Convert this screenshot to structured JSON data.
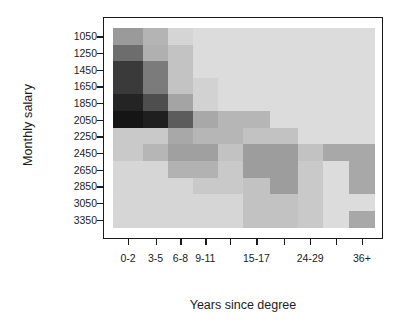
{
  "chart_data": {
    "type": "heatmap",
    "title": "",
    "xlabel": "Years since degree",
    "ylabel": "Monthly salary",
    "grid": false,
    "legend": "none",
    "x_categories": [
      "0-2",
      "3-5",
      "6-8",
      "9-11",
      "12-14",
      "15-17",
      "18-23",
      "24-29",
      "30-35",
      "36+"
    ],
    "x_tick_labels": [
      "0-2",
      "3-5",
      "6-8",
      "9-11",
      "",
      "15-17",
      "",
      "24-29",
      "",
      "36+"
    ],
    "y_categories": [
      "1050",
      "1250",
      "1450",
      "1650",
      "1850",
      "2050",
      "2250",
      "2450",
      "2650",
      "2850",
      "3050",
      "3350"
    ],
    "y_tick_labels": [
      "1050",
      "1250",
      "1450",
      "1650",
      "1850",
      "2050",
      "2250",
      "2450",
      "2650",
      "2850",
      "3050",
      "3350"
    ],
    "colorscale": {
      "type": "grayscale",
      "min_label": "low density",
      "max_label": "high density",
      "stops": [
        "#e2e2e2",
        "#d3d3d3",
        "#c4c4c4",
        "#a8a8a8",
        "#8c8c8c",
        "#6e6e6e",
        "#4a4a4a",
        "#2b2b2b",
        "#141414"
      ]
    },
    "values": [
      [
        0.62,
        0.5,
        0.3,
        0.14,
        0.14,
        0.14,
        0.14,
        0.14,
        0.14,
        0.14
      ],
      [
        0.74,
        0.5,
        0.38,
        0.14,
        0.14,
        0.14,
        0.14,
        0.14,
        0.14,
        0.14
      ],
      [
        0.92,
        0.66,
        0.38,
        0.14,
        0.14,
        0.14,
        0.14,
        0.14,
        0.14,
        0.14
      ],
      [
        0.92,
        0.66,
        0.38,
        0.3,
        0.14,
        0.14,
        0.14,
        0.14,
        0.14,
        0.14
      ],
      [
        0.95,
        0.86,
        0.46,
        0.3,
        0.14,
        0.14,
        0.14,
        0.14,
        0.14,
        0.14
      ],
      [
        0.98,
        0.92,
        0.66,
        0.38,
        0.3,
        0.14,
        0.14,
        0.14,
        0.14,
        0.14
      ],
      [
        0.24,
        0.3,
        0.48,
        0.3,
        0.3,
        0.14,
        0.14,
        0.14,
        0.14,
        0.14
      ],
      [
        0.24,
        0.36,
        0.48,
        0.48,
        0.24,
        0.44,
        0.44,
        0.24,
        0.36,
        0.36
      ],
      [
        0.18,
        0.18,
        0.36,
        0.24,
        0.24,
        0.44,
        0.44,
        0.24,
        0.14,
        0.36
      ],
      [
        0.18,
        0.18,
        0.18,
        0.24,
        0.24,
        0.3,
        0.44,
        0.24,
        0.14,
        0.36
      ],
      [
        0.18,
        0.18,
        0.18,
        0.18,
        0.18,
        0.3,
        0.3,
        0.24,
        0.14,
        0.14
      ],
      [
        0.18,
        0.18,
        0.18,
        0.18,
        0.18,
        0.3,
        0.3,
        0.24,
        0.14,
        0.36
      ]
    ],
    "cells": [
      {
        "x": 0,
        "y": 0,
        "w": 1,
        "h": 1,
        "color": "#9a9a9a"
      },
      {
        "x": 1,
        "y": 0,
        "w": 1,
        "h": 1,
        "color": "#b4b4b4"
      },
      {
        "x": 2,
        "y": 0,
        "w": 1,
        "h": 1,
        "color": "#d5d5d5"
      },
      {
        "x": 3,
        "y": 0,
        "w": 7,
        "h": 1,
        "color": "#dcdcdc"
      },
      {
        "x": 0,
        "y": 1,
        "w": 1,
        "h": 1,
        "color": "#6d6d6d"
      },
      {
        "x": 1,
        "y": 1,
        "w": 1,
        "h": 1,
        "color": "#b0b0b0"
      },
      {
        "x": 2,
        "y": 1,
        "w": 1,
        "h": 1,
        "color": "#c3c3c3"
      },
      {
        "x": 3,
        "y": 1,
        "w": 7,
        "h": 1,
        "color": "#dcdcdc"
      },
      {
        "x": 0,
        "y": 2,
        "w": 1,
        "h": 1,
        "color": "#3a3a3a"
      },
      {
        "x": 1,
        "y": 2,
        "w": 1,
        "h": 1,
        "color": "#7b7b7b"
      },
      {
        "x": 2,
        "y": 2,
        "w": 1,
        "h": 1,
        "color": "#c3c3c3"
      },
      {
        "x": 3,
        "y": 2,
        "w": 7,
        "h": 1,
        "color": "#dcdcdc"
      },
      {
        "x": 0,
        "y": 3,
        "w": 1,
        "h": 1,
        "color": "#3a3a3a"
      },
      {
        "x": 1,
        "y": 3,
        "w": 1,
        "h": 1,
        "color": "#7b7b7b"
      },
      {
        "x": 2,
        "y": 3,
        "w": 1,
        "h": 1,
        "color": "#c3c3c3"
      },
      {
        "x": 3,
        "y": 3,
        "w": 1,
        "h": 1,
        "color": "#d2d2d2"
      },
      {
        "x": 4,
        "y": 3,
        "w": 6,
        "h": 1,
        "color": "#dcdcdc"
      },
      {
        "x": 0,
        "y": 4,
        "w": 1,
        "h": 1,
        "color": "#242424"
      },
      {
        "x": 1,
        "y": 4,
        "w": 1,
        "h": 1,
        "color": "#4e4e4e"
      },
      {
        "x": 2,
        "y": 4,
        "w": 1,
        "h": 1,
        "color": "#a4a4a4"
      },
      {
        "x": 3,
        "y": 4,
        "w": 1,
        "h": 1,
        "color": "#d2d2d2"
      },
      {
        "x": 4,
        "y": 4,
        "w": 6,
        "h": 1,
        "color": "#dcdcdc"
      },
      {
        "x": 0,
        "y": 5,
        "w": 1,
        "h": 1,
        "color": "#151515"
      },
      {
        "x": 1,
        "y": 5,
        "w": 1,
        "h": 1,
        "color": "#1f1f1f"
      },
      {
        "x": 2,
        "y": 5,
        "w": 1,
        "h": 1,
        "color": "#5c5c5c"
      },
      {
        "x": 3,
        "y": 5,
        "w": 1,
        "h": 1,
        "color": "#a8a8a8"
      },
      {
        "x": 4,
        "y": 5,
        "w": 2,
        "h": 1,
        "color": "#b6b6b6"
      },
      {
        "x": 6,
        "y": 5,
        "w": 4,
        "h": 1,
        "color": "#dcdcdc"
      },
      {
        "x": 0,
        "y": 6,
        "w": 1,
        "h": 1,
        "color": "#c9c9c9"
      },
      {
        "x": 1,
        "y": 6,
        "w": 1,
        "h": 1,
        "color": "#c9c9c9"
      },
      {
        "x": 2,
        "y": 6,
        "w": 1,
        "h": 1,
        "color": "#a8a8a8"
      },
      {
        "x": 3,
        "y": 6,
        "w": 2,
        "h": 1,
        "color": "#b6b6b6"
      },
      {
        "x": 5,
        "y": 6,
        "w": 2,
        "h": 1,
        "color": "#c2c2c2"
      },
      {
        "x": 7,
        "y": 6,
        "w": 3,
        "h": 1,
        "color": "#dcdcdc"
      },
      {
        "x": 0,
        "y": 7,
        "w": 1,
        "h": 1,
        "color": "#c9c9c9"
      },
      {
        "x": 1,
        "y": 7,
        "w": 1,
        "h": 1,
        "color": "#b6b6b6"
      },
      {
        "x": 2,
        "y": 7,
        "w": 2,
        "h": 1,
        "color": "#a0a0a0"
      },
      {
        "x": 4,
        "y": 7,
        "w": 1,
        "h": 1,
        "color": "#c2c2c2"
      },
      {
        "x": 5,
        "y": 7,
        "w": 2,
        "h": 1,
        "color": "#9d9d9d"
      },
      {
        "x": 7,
        "y": 7,
        "w": 1,
        "h": 1,
        "color": "#c2c2c2"
      },
      {
        "x": 8,
        "y": 7,
        "w": 2,
        "h": 1,
        "color": "#a8a8a8"
      },
      {
        "x": 0,
        "y": 8,
        "w": 2,
        "h": 1,
        "color": "#d6d6d6"
      },
      {
        "x": 2,
        "y": 8,
        "w": 2,
        "h": 1,
        "color": "#b2b2b2"
      },
      {
        "x": 4,
        "y": 8,
        "w": 1,
        "h": 1,
        "color": "#c9c9c9"
      },
      {
        "x": 5,
        "y": 8,
        "w": 2,
        "h": 1,
        "color": "#9d9d9d"
      },
      {
        "x": 7,
        "y": 8,
        "w": 1,
        "h": 1,
        "color": "#c9c9c9"
      },
      {
        "x": 8,
        "y": 8,
        "w": 1,
        "h": 1,
        "color": "#dcdcdc"
      },
      {
        "x": 9,
        "y": 8,
        "w": 1,
        "h": 1,
        "color": "#a8a8a8"
      },
      {
        "x": 0,
        "y": 9,
        "w": 3,
        "h": 1,
        "color": "#d6d6d6"
      },
      {
        "x": 3,
        "y": 9,
        "w": 2,
        "h": 1,
        "color": "#c9c9c9"
      },
      {
        "x": 5,
        "y": 9,
        "w": 1,
        "h": 1,
        "color": "#c2c2c2"
      },
      {
        "x": 6,
        "y": 9,
        "w": 1,
        "h": 1,
        "color": "#9d9d9d"
      },
      {
        "x": 7,
        "y": 9,
        "w": 1,
        "h": 1,
        "color": "#c9c9c9"
      },
      {
        "x": 8,
        "y": 9,
        "w": 1,
        "h": 1,
        "color": "#dcdcdc"
      },
      {
        "x": 9,
        "y": 9,
        "w": 1,
        "h": 1,
        "color": "#a8a8a8"
      },
      {
        "x": 0,
        "y": 10,
        "w": 5,
        "h": 1,
        "color": "#d6d6d6"
      },
      {
        "x": 5,
        "y": 10,
        "w": 2,
        "h": 1,
        "color": "#c2c2c2"
      },
      {
        "x": 7,
        "y": 10,
        "w": 1,
        "h": 1,
        "color": "#c9c9c9"
      },
      {
        "x": 8,
        "y": 10,
        "w": 2,
        "h": 1,
        "color": "#dcdcdc"
      },
      {
        "x": 0,
        "y": 11,
        "w": 5,
        "h": 1,
        "color": "#d6d6d6"
      },
      {
        "x": 5,
        "y": 11,
        "w": 2,
        "h": 1,
        "color": "#c2c2c2"
      },
      {
        "x": 7,
        "y": 11,
        "w": 1,
        "h": 1,
        "color": "#c9c9c9"
      },
      {
        "x": 8,
        "y": 11,
        "w": 1,
        "h": 1,
        "color": "#dcdcdc"
      },
      {
        "x": 9,
        "y": 11,
        "w": 1,
        "h": 1,
        "color": "#a8a8a8"
      }
    ],
    "column_widths": [
      0.115,
      0.095,
      0.095,
      0.095,
      0.095,
      0.105,
      0.105,
      0.095,
      0.1,
      0.1
    ],
    "row_heights": [
      0.083,
      0.083,
      0.083,
      0.083,
      0.083,
      0.083,
      0.083,
      0.083,
      0.083,
      0.083,
      0.084,
      0.085
    ]
  }
}
